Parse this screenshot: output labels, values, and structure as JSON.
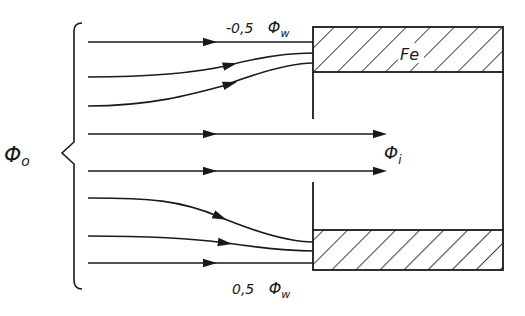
{
  "diagram": {
    "type": "magnetic flux shielding",
    "labels": {
      "phi_o": "Φ",
      "phi_o_sub": "o",
      "phi_i": "Φ",
      "phi_i_sub": "i",
      "top_coef": "-0,5",
      "top_phi": "Φ",
      "top_sub": "w",
      "bottom_coef": "0,5",
      "bottom_phi": "Φ",
      "bottom_sub": "w",
      "material": "Fe"
    },
    "colors": {
      "line": "#1a1a1a",
      "background": "#ffffff"
    },
    "flux_lines": [
      {
        "id": "top-straight",
        "description": "straight into upper Fe wall"
      },
      {
        "id": "top-curve-1",
        "description": "curves up into upper Fe wall"
      },
      {
        "id": "top-curve-2",
        "description": "curves up into upper Fe wall"
      },
      {
        "id": "center-1",
        "description": "passes through opening as Φi"
      },
      {
        "id": "center-2",
        "description": "passes through opening as Φi"
      },
      {
        "id": "bottom-curve-1",
        "description": "curves down into lower Fe wall"
      },
      {
        "id": "bottom-curve-2",
        "description": "curves down into lower Fe wall"
      },
      {
        "id": "bottom-straight",
        "description": "straight into lower Fe wall"
      }
    ]
  }
}
